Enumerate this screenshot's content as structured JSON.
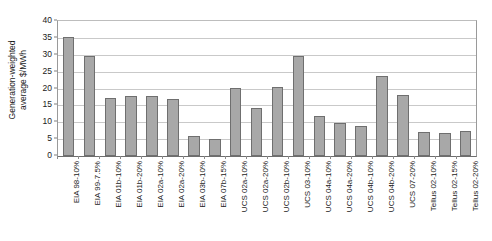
{
  "chart_data": {
    "type": "bar",
    "title": "",
    "xlabel": "",
    "ylabel": "Generation-weighted average $/MWh",
    "ylabel_lines": [
      "Generation-weighted",
      "average $/MWh"
    ],
    "ylim": [
      0,
      40
    ],
    "yticks": [
      0,
      5,
      10,
      15,
      20,
      25,
      30,
      35,
      40
    ],
    "ytick_labels": [
      "0",
      "5",
      "10",
      "15",
      "20",
      "25",
      "30",
      "35",
      "40"
    ],
    "grid": true,
    "legend": "none",
    "bar_color": "#a8a8a8",
    "bar_border_color": "#6f6f6f",
    "categories": [
      "EIA 98-10%",
      "EIA 99-7.5%",
      "EIA 01b-10%",
      "EIA 01b-20%",
      "EIA 02a-10%",
      "EIA 02a-20%",
      "EIA 03b-10%",
      "EIA 07b-15%",
      "UCS 02a-10%",
      "UCS 02a-20%",
      "UCS 02b-10%",
      "UCS 03-10%",
      "UCS 04a-10%",
      "UCS 04a-20%",
      "UCS 04b-10%",
      "UCS 04b-20%",
      "UCS 07-20%",
      "Tellus 02-10%",
      "Tellus 02-15%",
      "Tellus 02-20%"
    ],
    "values": [
      35.3,
      29.6,
      17.1,
      17.8,
      17.8,
      16.9,
      5.8,
      5.0,
      20.1,
      14.2,
      20.5,
      29.5,
      12.0,
      9.7,
      9.0,
      23.8,
      18.0,
      7.0,
      6.7,
      7.5
    ]
  }
}
